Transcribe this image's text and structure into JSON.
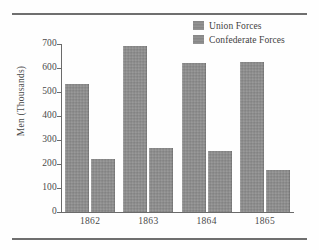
{
  "figure": {
    "background_color": "#fefefe",
    "rule_color": "#6f6f6f"
  },
  "legend": {
    "position": "top-right",
    "entries": [
      {
        "label": "Union Forces",
        "color": "#8c8c8c",
        "swatch_icon": "legend-swatch-icon"
      },
      {
        "label": "Confederate Forces",
        "color": "#8c8c8c",
        "swatch_icon": "legend-swatch-icon"
      }
    ]
  },
  "axes": {
    "y_title": "Men (Thousands)",
    "y_ticks": [
      "0",
      "100",
      "200",
      "300",
      "400",
      "500",
      "600",
      "700"
    ],
    "x_ticks": [
      "1862",
      "1863",
      "1864",
      "1865"
    ]
  },
  "chart_data": {
    "type": "bar",
    "title": "",
    "subtitle": "",
    "xlabel": "",
    "ylabel": "Men (Thousands)",
    "categories": [
      "1862",
      "1863",
      "1864",
      "1865"
    ],
    "series": [
      {
        "name": "Union Forces",
        "color": "#8c8c8c",
        "values": [
          535,
          690,
          620,
          625
        ]
      },
      {
        "name": "Confederate Forces",
        "color": "#8c8c8c",
        "values": [
          220,
          265,
          255,
          175
        ]
      }
    ],
    "ylim": [
      0,
      700
    ],
    "ytick_step": 100,
    "grid": false,
    "legend_position": "top-right",
    "units": "thousands of men"
  }
}
